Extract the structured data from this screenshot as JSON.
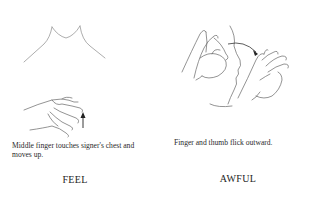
{
  "signs": [
    {
      "word": "FEEL",
      "caption": "Middle finger touches signer's chest and moves up.",
      "illustration": "chest-outline-with-hand-touching-and-upward-arrow"
    },
    {
      "word": "AWFUL",
      "caption": "Finger and thumb flick outward.",
      "illustration": "face-profile-with-hands-flicking-and-curved-arrow"
    }
  ],
  "colors": {
    "background": "#ffffff",
    "line_art": "#555555",
    "text": "#222222"
  }
}
